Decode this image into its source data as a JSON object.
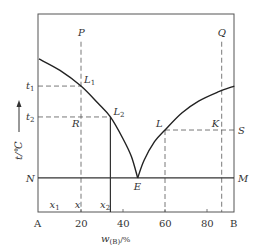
{
  "diagram": {
    "type": "binary-eutectic-phase-diagram",
    "axes": {
      "x_label": "w",
      "x_label_sub": "(B)",
      "x_label_unit": "/%",
      "x_range": [
        0,
        93
      ],
      "x_ticks": [
        {
          "value": 20,
          "label": "20"
        },
        {
          "value": 40,
          "label": "40"
        },
        {
          "value": 60,
          "label": "60"
        },
        {
          "value": 80,
          "label": "80"
        }
      ],
      "x_end_labels": {
        "left": "A",
        "right": "B"
      },
      "y_label": "t/℃",
      "y_range": [
        0,
        100
      ]
    },
    "curves": {
      "left_liquidus": [
        [
          0,
          77.3
        ],
        [
          10,
          71.5
        ],
        [
          20,
          63.6
        ],
        [
          28,
          55
        ],
        [
          34,
          48
        ],
        [
          40,
          37
        ],
        [
          44,
          28
        ],
        [
          47,
          17.2
        ]
      ],
      "right_liquidus": [
        [
          47,
          17.2
        ],
        [
          50,
          26
        ],
        [
          55,
          35.5
        ],
        [
          60,
          41.4
        ],
        [
          68,
          50
        ],
        [
          76,
          56
        ],
        [
          85,
          60.5
        ],
        [
          93,
          63.6
        ]
      ]
    },
    "points": {
      "L1": {
        "label": "L",
        "sub": "1",
        "x": 20,
        "y": 63.6
      },
      "L2": {
        "label": "L",
        "sub": "2",
        "x": 34,
        "y": 48
      },
      "E": {
        "label": "E",
        "x": 47,
        "y": 17.2
      },
      "L": {
        "label": "L",
        "x": 60,
        "y": 41.4
      },
      "K": {
        "label": "K",
        "x": 87,
        "y": 41.4
      },
      "R": {
        "label": "R",
        "x": 20,
        "y": 48
      },
      "P": {
        "label": "P",
        "x": 20,
        "y": 89
      },
      "Q": {
        "label": "Q",
        "x": 87,
        "y": 89
      },
      "S": {
        "label": "S",
        "x": 93,
        "y": 41.4
      },
      "N": {
        "label": "N",
        "x": 0,
        "y": 17.2
      },
      "M": {
        "label": "M",
        "x": 93,
        "y": 17.2
      }
    },
    "temperature_labels": {
      "t1": {
        "label": "t",
        "sub": "1",
        "y": 63.6
      },
      "t2": {
        "label": "t",
        "sub": "2",
        "y": 48
      }
    },
    "composition_labels": {
      "x1": {
        "label": "x",
        "sub": "1",
        "x": 6
      },
      "x": {
        "label": "x",
        "x": 18
      },
      "x2": {
        "label": "x",
        "sub": "2",
        "x": 30
      }
    },
    "eutectic_line_y": 17.2,
    "vertical_lines": {
      "P_line_x": 20,
      "x2_line_x": 34,
      "L_line_x": 60,
      "Q_line_x": 87
    }
  }
}
